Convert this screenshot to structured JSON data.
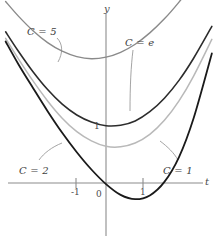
{
  "figure": {
    "width": 221,
    "height": 242,
    "background": "#ffffff"
  },
  "axes": {
    "x_name": "t",
    "y_name": "y",
    "x_ticks": [
      {
        "label": "-1",
        "value": -1
      },
      {
        "label": "0",
        "value": 0
      },
      {
        "label": "1",
        "value": 1
      }
    ],
    "y_ticks": [
      {
        "label": "1",
        "value": 1
      }
    ],
    "axis_color": "#8c8c8c",
    "origin_px": {
      "x": 106,
      "y": 183
    },
    "unit_px": {
      "x": 36.5,
      "y": 54
    }
  },
  "labels": {
    "c5": "C = 5",
    "ce": "C = e",
    "c2": "C = 2",
    "c1": "C = 1"
  },
  "chart_data": {
    "type": "line",
    "xlabel": "t",
    "ylabel": "y",
    "xlim": [
      -2.9,
      3.2
    ],
    "ylim": [
      -0.6,
      3.6
    ],
    "grid": false,
    "legend": "annotations",
    "x_ticks": [
      -1,
      0,
      1
    ],
    "y_ticks": [
      1
    ],
    "annotations": [
      {
        "text": "C = 5",
        "x": -2.15,
        "y": 3.05,
        "leader_to": {
          "x": -1.55,
          "y": 2.45
        }
      },
      {
        "text": "C = e",
        "x": 0.6,
        "y": 2.82,
        "leader_to": {
          "x": 0.62,
          "y": 1.9
        }
      },
      {
        "text": "C = 2",
        "x": -2.35,
        "y": 0.35,
        "leader_to": {
          "x": -1.45,
          "y": 0.62
        }
      },
      {
        "text": "C = 1",
        "x": 1.6,
        "y": 0.35,
        "leader_to": {
          "x": 1.25,
          "y": 0.95
        }
      }
    ],
    "series": [
      {
        "name": "C = 5",
        "C": 5,
        "color": "#8a8a8a",
        "width": 1.4,
        "x": [
          -2.75,
          -2.4,
          -2.0,
          -1.6,
          -1.2,
          -0.8,
          -0.4,
          0.0,
          0.4,
          0.8,
          1.2,
          1.6,
          2.0,
          2.4,
          2.9
        ],
        "y": [
          3.36,
          3.09,
          2.82,
          2.6,
          2.44,
          2.34,
          2.3,
          2.33,
          2.42,
          2.57,
          2.78,
          3.04,
          3.35,
          3.7,
          4.2
        ]
      },
      {
        "name": "C = e",
        "C": 2.718,
        "color": "#2c2c2c",
        "width": 1.6,
        "x": [
          -2.75,
          -2.4,
          -2.0,
          -1.6,
          -1.2,
          -0.8,
          -0.4,
          0.0,
          0.4,
          0.8,
          1.2,
          1.6,
          2.0,
          2.4,
          2.9
        ],
        "y": [
          2.8,
          2.44,
          2.06,
          1.73,
          1.46,
          1.26,
          1.13,
          1.06,
          1.07,
          1.15,
          1.32,
          1.57,
          1.9,
          2.31,
          2.9
        ]
      },
      {
        "name": "C = 2",
        "C": 2,
        "color": "#b9b9b9",
        "width": 1.5,
        "x": [
          -2.75,
          -2.4,
          -2.0,
          -1.6,
          -1.2,
          -0.8,
          -0.4,
          0.0,
          0.4,
          0.8,
          1.2,
          1.6,
          2.0,
          2.4,
          2.9
        ],
        "y": [
          2.68,
          2.3,
          1.89,
          1.52,
          1.2,
          0.95,
          0.78,
          0.68,
          0.67,
          0.74,
          0.9,
          1.16,
          1.52,
          1.98,
          2.66
        ]
      },
      {
        "name": "C = 1",
        "C": 1,
        "color": "#1a1a1a",
        "width": 1.8,
        "x": [
          -2.75,
          -2.4,
          -2.0,
          -1.6,
          -1.2,
          -0.8,
          -0.4,
          0.0,
          0.4,
          0.8,
          1.2,
          1.6,
          2.0,
          2.4,
          2.9
        ],
        "y": [
          2.62,
          2.2,
          1.76,
          1.33,
          0.93,
          0.57,
          0.25,
          -0.02,
          -0.22,
          -0.3,
          -0.23,
          0.02,
          0.48,
          1.2,
          2.4
        ]
      }
    ]
  }
}
